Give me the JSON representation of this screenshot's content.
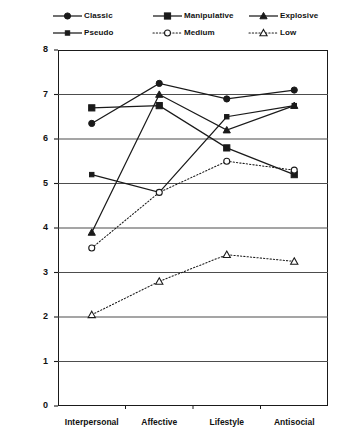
{
  "chart_data": {
    "type": "line",
    "title": "",
    "xlabel": "",
    "ylabel": "",
    "categories": [
      "Interpersonal",
      "Affective",
      "Lifestyle",
      "Antisocial"
    ],
    "ylim": [
      0,
      8
    ],
    "yticks": [
      "0",
      "1",
      "2",
      "3",
      "4",
      "5",
      "6",
      "7",
      "8"
    ],
    "grid": true,
    "legend_position": "top",
    "series": [
      {
        "name": "Classic",
        "marker": "filled-circle",
        "line": "solid",
        "values": [
          6.35,
          7.25,
          6.9,
          7.1
        ]
      },
      {
        "name": "Manipulative",
        "marker": "filled-square",
        "line": "solid",
        "values": [
          6.7,
          6.75,
          5.8,
          5.2
        ]
      },
      {
        "name": "Explosive",
        "marker": "filled-triangle",
        "line": "solid",
        "values": [
          3.9,
          7.0,
          6.2,
          6.75
        ]
      },
      {
        "name": "Pseudo",
        "marker": "small-filled-square",
        "line": "solid",
        "values": [
          5.2,
          4.8,
          6.5,
          6.75
        ]
      },
      {
        "name": "Medium",
        "marker": "open-circle",
        "line": "dotted",
        "values": [
          3.55,
          4.8,
          5.5,
          5.3
        ]
      },
      {
        "name": "Low",
        "marker": "open-triangle",
        "line": "dotted",
        "values": [
          2.05,
          2.8,
          3.4,
          3.25
        ]
      }
    ]
  },
  "legend": {
    "items": [
      {
        "label": "Classic",
        "marker": "filled-circle",
        "line": "solid"
      },
      {
        "label": "Manipulative",
        "marker": "filled-square",
        "line": "solid"
      },
      {
        "label": "Explosive",
        "marker": "filled-triangle",
        "line": "solid"
      },
      {
        "label": "Pseudo",
        "marker": "small-filled-square",
        "line": "solid"
      },
      {
        "label": "Medium",
        "marker": "open-circle",
        "line": "dotted"
      },
      {
        "label": "Low",
        "marker": "open-triangle",
        "line": "dotted"
      }
    ]
  },
  "colors": {
    "ink": "#1a1a1a",
    "grid": "#4d4d4d",
    "background": "#ffffff"
  }
}
